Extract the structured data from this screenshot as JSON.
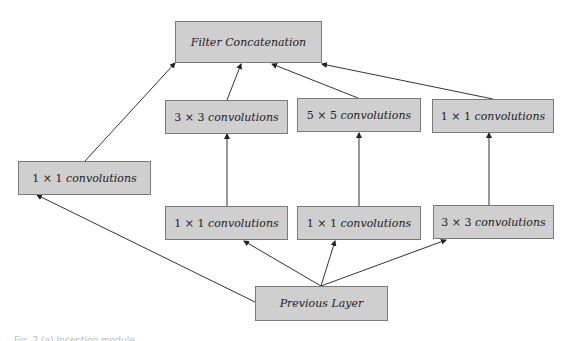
{
  "diagram": {
    "title": "Inception module",
    "nodes": {
      "filter_concat": {
        "label": "Filter Concatenation"
      },
      "conv3x3_top": {
        "prefix": "3 × 3",
        "label": "convolutions"
      },
      "conv5x5_top": {
        "prefix": "5 × 5",
        "label": "convolutions"
      },
      "conv1x1_top_right": {
        "prefix": "1 × 1",
        "label": "convolutions"
      },
      "conv1x1_left": {
        "prefix": "1 × 1",
        "label": "convolutions"
      },
      "conv1x1_bottom_a": {
        "prefix": "1 × 1",
        "label": "convolutions"
      },
      "conv1x1_bottom_b": {
        "prefix": "1 × 1",
        "label": "convolutions"
      },
      "conv3x3_bottom_right": {
        "prefix": "3 × 3",
        "label": "convolutions"
      },
      "previous_layer": {
        "label": "Previous Layer"
      }
    },
    "edges": [
      {
        "from": "previous_layer",
        "to": "conv1x1_left"
      },
      {
        "from": "previous_layer",
        "to": "conv1x1_bottom_a"
      },
      {
        "from": "previous_layer",
        "to": "conv1x1_bottom_b"
      },
      {
        "from": "previous_layer",
        "to": "conv3x3_bottom_right"
      },
      {
        "from": "conv1x1_bottom_a",
        "to": "conv3x3_top"
      },
      {
        "from": "conv1x1_bottom_b",
        "to": "conv5x5_top"
      },
      {
        "from": "conv3x3_bottom_right",
        "to": "conv1x1_top_right"
      },
      {
        "from": "conv1x1_left",
        "to": "filter_concat"
      },
      {
        "from": "conv3x3_top",
        "to": "filter_concat"
      },
      {
        "from": "conv5x5_top",
        "to": "filter_concat"
      },
      {
        "from": "conv1x1_top_right",
        "to": "filter_concat"
      }
    ],
    "colors": {
      "box_fill": "#cfcfcf",
      "box_border": "#7a7a7a",
      "line": "#333333"
    }
  },
  "caption": "Fig. 2 (a) Inception module"
}
